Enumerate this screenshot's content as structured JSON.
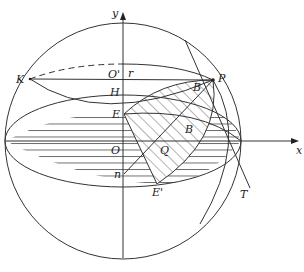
{
  "diagram": {
    "type": "geometry-sphere-projection",
    "axes": {
      "x_label": "x",
      "y_label": "y"
    },
    "points": {
      "K": "K",
      "O_prime": "O'",
      "r": "r",
      "P": "P",
      "H": "H",
      "E": "E",
      "B_upper": "B",
      "B_lower": "B",
      "O": "O",
      "Q": "Q",
      "n": "n",
      "E_prime": "E'",
      "T": "T"
    },
    "colors": {
      "stroke": "#333333",
      "background": "#ffffff"
    }
  }
}
